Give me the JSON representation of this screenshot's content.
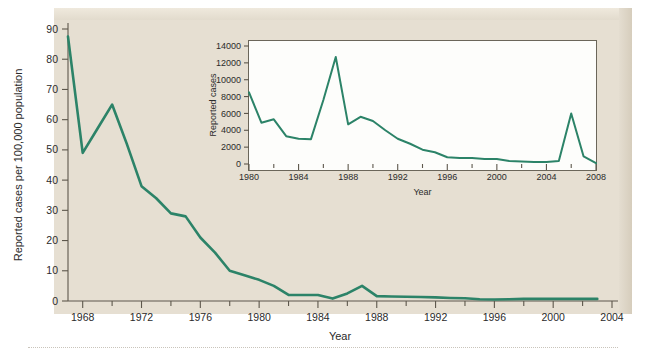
{
  "chart_data": [
    {
      "id": "main",
      "type": "line",
      "title": "",
      "xlabel": "Year",
      "ylabel": "Reported cases per 100,000 population",
      "xlim": [
        1967,
        2004
      ],
      "ylim": [
        0,
        90
      ],
      "ytick_values": [
        0,
        10,
        20,
        30,
        40,
        50,
        60,
        70,
        80,
        90
      ],
      "ytick_labels": [
        "0",
        "10",
        "20",
        "30",
        "40",
        "50",
        "60",
        "70",
        "80",
        "90"
      ],
      "xtick_labels": [
        "1968",
        "1972",
        "1976",
        "1980",
        "1984",
        "1988",
        "1992",
        "1996",
        "2000",
        "2004"
      ],
      "xtick_values": [
        1968,
        1972,
        1976,
        1980,
        1984,
        1988,
        1992,
        1996,
        2000,
        2004
      ],
      "xminor_step": 2,
      "grid": false,
      "legend": false,
      "line_color": "#2c8368",
      "plot_background": "#e6dfd2",
      "x": [
        1967,
        1968,
        1969,
        1970,
        1971,
        1972,
        1973,
        1974,
        1975,
        1976,
        1977,
        1978,
        1979,
        1980,
        1981,
        1982,
        1983,
        1984,
        1985,
        1986,
        1987,
        1988,
        1989,
        1990,
        1991,
        1992,
        1993,
        1994,
        1995,
        1996,
        1997,
        1998,
        1999,
        2000,
        2001,
        2002,
        2003
      ],
      "y": [
        87.5,
        49.0,
        57.0,
        65.0,
        52.0,
        38.0,
        34.0,
        29.0,
        28.0,
        21.0,
        16.0,
        10.0,
        8.5,
        7.0,
        5.0,
        2.0,
        2.0,
        2.0,
        0.8,
        2.5,
        5.0,
        1.6,
        1.5,
        1.4,
        1.3,
        1.2,
        1.0,
        0.9,
        0.6,
        0.5,
        0.6,
        0.7,
        0.7,
        0.7,
        0.7,
        0.7,
        0.7
      ]
    },
    {
      "id": "inset",
      "type": "line",
      "title": "",
      "xlabel": "Year",
      "ylabel": "Reported cases",
      "xlim": [
        1980,
        2008
      ],
      "ylim": [
        0,
        14000
      ],
      "ytick_values": [
        0,
        2000,
        4000,
        6000,
        8000,
        10000,
        12000,
        14000
      ],
      "ytick_labels": [
        "0",
        "2000",
        "4000",
        "6000",
        "8000",
        "10000",
        "12000",
        "14000"
      ],
      "xtick_labels": [
        "1980",
        "1984",
        "1988",
        "1992",
        "1996",
        "2000",
        "2004",
        "2008"
      ],
      "xtick_values": [
        1980,
        1984,
        1988,
        1992,
        1996,
        2000,
        2004,
        2008
      ],
      "xminor_step": 2,
      "grid": false,
      "legend": false,
      "line_color": "#2c8368",
      "plot_background": "#fdfdfb",
      "x": [
        1980,
        1981,
        1982,
        1983,
        1984,
        1985,
        1986,
        1987,
        1988,
        1989,
        1990,
        1991,
        1992,
        1993,
        1994,
        1995,
        1996,
        1997,
        1998,
        1999,
        2000,
        2001,
        2002,
        2003,
        2004,
        2005,
        2006,
        2007,
        2008
      ],
      "y": [
        8500,
        4900,
        5300,
        3300,
        3000,
        2950,
        7600,
        12700,
        4700,
        5600,
        5100,
        4000,
        3000,
        2400,
        1700,
        1400,
        800,
        700,
        700,
        600,
        600,
        350,
        300,
        250,
        250,
        350,
        6000,
        900,
        100
      ]
    }
  ],
  "main_axis": {
    "ylabel": "Reported cases per 100,000 population",
    "xlabel": "Year"
  },
  "inset_axis": {
    "ylabel": "Reported cases",
    "xlabel": "Year"
  }
}
